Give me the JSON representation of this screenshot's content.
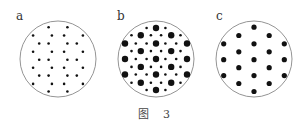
{
  "figure": {
    "caption_prefix": "图",
    "caption_number": "3",
    "panels": [
      {
        "label": "a",
        "description": "small uniform dots in hexagonal arrangement",
        "dots": [
          [
            -0.26,
            -0.88,
            "s"
          ],
          [
            0.26,
            -0.88,
            "s"
          ],
          [
            -0.69,
            -0.65,
            "s"
          ],
          [
            -0.17,
            -0.65,
            "s"
          ],
          [
            0.17,
            -0.65,
            "s"
          ],
          [
            0.69,
            -0.65,
            "s"
          ],
          [
            -0.52,
            -0.43,
            "s"
          ],
          [
            -0.26,
            -0.43,
            "s"
          ],
          [
            0.26,
            -0.43,
            "s"
          ],
          [
            0.52,
            -0.43,
            "s"
          ],
          [
            -0.69,
            -0.2,
            "s"
          ],
          [
            -0.17,
            -0.2,
            "s"
          ],
          [
            0.17,
            -0.2,
            "s"
          ],
          [
            0.69,
            -0.2,
            "s"
          ],
          [
            -0.52,
            0.02,
            "s"
          ],
          [
            -0.26,
            0.02,
            "s"
          ],
          [
            0.26,
            0.02,
            "s"
          ],
          [
            0.52,
            0.02,
            "s"
          ],
          [
            -0.69,
            0.24,
            "s"
          ],
          [
            -0.17,
            0.24,
            "s"
          ],
          [
            0.17,
            0.24,
            "s"
          ],
          [
            0.69,
            0.24,
            "s"
          ],
          [
            -0.52,
            0.46,
            "s"
          ],
          [
            -0.26,
            0.46,
            "s"
          ],
          [
            0.26,
            0.46,
            "s"
          ],
          [
            0.52,
            0.46,
            "s"
          ],
          [
            -0.69,
            0.69,
            "s"
          ],
          [
            -0.17,
            0.69,
            "s"
          ],
          [
            0.17,
            0.69,
            "s"
          ],
          [
            0.69,
            0.69,
            "s"
          ],
          [
            -0.26,
            0.9,
            "s"
          ],
          [
            0.26,
            0.9,
            "s"
          ]
        ]
      },
      {
        "label": "b",
        "description": "large and small dots combined",
        "dots": [
          [
            -0.26,
            -0.86,
            "s"
          ],
          [
            0,
            -0.86,
            "l"
          ],
          [
            0.26,
            -0.86,
            "s"
          ],
          [
            -0.68,
            -0.66,
            "s"
          ],
          [
            -0.42,
            -0.66,
            "l"
          ],
          [
            -0.14,
            -0.66,
            "s"
          ],
          [
            0.14,
            -0.66,
            "s"
          ],
          [
            0.42,
            -0.66,
            "l"
          ],
          [
            0.68,
            -0.66,
            "s"
          ],
          [
            -0.86,
            -0.43,
            "l"
          ],
          [
            -0.56,
            -0.43,
            "s"
          ],
          [
            -0.26,
            -0.43,
            "s"
          ],
          [
            0,
            -0.43,
            "l"
          ],
          [
            0.26,
            -0.43,
            "s"
          ],
          [
            0.56,
            -0.43,
            "s"
          ],
          [
            0.86,
            -0.43,
            "l"
          ],
          [
            -0.68,
            -0.22,
            "s"
          ],
          [
            -0.42,
            -0.22,
            "l"
          ],
          [
            -0.14,
            -0.22,
            "s"
          ],
          [
            0.14,
            -0.22,
            "s"
          ],
          [
            0.42,
            -0.22,
            "l"
          ],
          [
            0.68,
            -0.22,
            "s"
          ],
          [
            -0.86,
            0.0,
            "l"
          ],
          [
            -0.56,
            0.0,
            "s"
          ],
          [
            -0.26,
            0.0,
            "s"
          ],
          [
            0,
            0.0,
            "l"
          ],
          [
            0.26,
            0.0,
            "s"
          ],
          [
            0.56,
            0.0,
            "s"
          ],
          [
            0.86,
            0.0,
            "l"
          ],
          [
            -0.68,
            0.22,
            "s"
          ],
          [
            -0.42,
            0.22,
            "l"
          ],
          [
            -0.14,
            0.22,
            "s"
          ],
          [
            0.14,
            0.22,
            "s"
          ],
          [
            0.42,
            0.22,
            "l"
          ],
          [
            0.68,
            0.22,
            "s"
          ],
          [
            -0.86,
            0.43,
            "l"
          ],
          [
            -0.56,
            0.43,
            "s"
          ],
          [
            -0.26,
            0.43,
            "s"
          ],
          [
            0,
            0.43,
            "l"
          ],
          [
            0.26,
            0.43,
            "s"
          ],
          [
            0.56,
            0.43,
            "s"
          ],
          [
            0.86,
            0.43,
            "l"
          ],
          [
            -0.68,
            0.66,
            "s"
          ],
          [
            -0.42,
            0.66,
            "l"
          ],
          [
            -0.14,
            0.66,
            "s"
          ],
          [
            0.14,
            0.66,
            "s"
          ],
          [
            0.42,
            0.66,
            "l"
          ],
          [
            0.68,
            0.66,
            "s"
          ],
          [
            -0.26,
            0.86,
            "s"
          ],
          [
            0,
            0.86,
            "l"
          ],
          [
            0.26,
            0.86,
            "s"
          ]
        ]
      },
      {
        "label": "c",
        "description": "medium dots in sparse hexagonal arrangement",
        "dots": [
          [
            0,
            -0.88,
            "m"
          ],
          [
            -0.42,
            -0.65,
            "m"
          ],
          [
            0.42,
            -0.65,
            "m"
          ],
          [
            -0.84,
            -0.42,
            "m"
          ],
          [
            0,
            -0.42,
            "m"
          ],
          [
            0.84,
            -0.42,
            "m"
          ],
          [
            -0.42,
            -0.2,
            "m"
          ],
          [
            0.42,
            -0.2,
            "m"
          ],
          [
            -0.84,
            0.02,
            "m"
          ],
          [
            0,
            0.02,
            "m"
          ],
          [
            0.84,
            0.02,
            "m"
          ],
          [
            -0.42,
            0.24,
            "m"
          ],
          [
            0.42,
            0.24,
            "m"
          ],
          [
            -0.84,
            0.46,
            "m"
          ],
          [
            0,
            0.46,
            "m"
          ],
          [
            0.84,
            0.46,
            "m"
          ],
          [
            -0.42,
            0.68,
            "m"
          ],
          [
            0.42,
            0.68,
            "m"
          ],
          [
            0,
            0.9,
            "m"
          ]
        ]
      }
    ]
  }
}
